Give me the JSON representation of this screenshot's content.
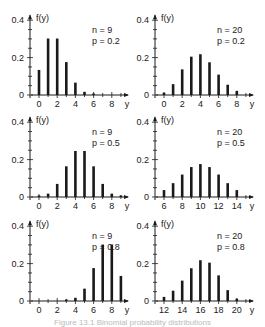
{
  "figure": {
    "caption": "Figure 13.1   Binomial probability distributions"
  },
  "chart_data": [
    {
      "type": "bar",
      "title": "",
      "annotation": [
        "n = 9",
        "p = 0.2"
      ],
      "ylabel": "f(y)",
      "xlabel": "y",
      "ylim": [
        0,
        0.4
      ],
      "yticks": [
        0,
        0.2,
        0.4
      ],
      "ytick_labels": [
        "0",
        "0.2",
        "0.4"
      ],
      "xlim": [
        0,
        9
      ],
      "xticks": [
        0,
        2,
        4,
        6,
        8
      ],
      "x": [
        0,
        1,
        2,
        3,
        4,
        5,
        6,
        7,
        8,
        9
      ],
      "values": [
        0.134,
        0.302,
        0.302,
        0.176,
        0.066,
        0.017,
        0.003,
        0.0,
        0.0,
        0.0
      ],
      "grid": false
    },
    {
      "type": "bar",
      "title": "",
      "annotation": [
        "n = 20",
        "p = 0.2"
      ],
      "ylabel": "f(y)",
      "xlabel": "y",
      "ylim": [
        0,
        0.4
      ],
      "yticks": [
        0,
        0.2,
        0.4
      ],
      "ytick_labels": [
        "0",
        "0.2",
        "0.4"
      ],
      "xlim": [
        0,
        9
      ],
      "xticks": [
        0,
        2,
        4,
        6,
        8
      ],
      "x": [
        0,
        1,
        2,
        3,
        4,
        5,
        6,
        7,
        8
      ],
      "values": [
        0.012,
        0.058,
        0.137,
        0.205,
        0.218,
        0.175,
        0.109,
        0.055,
        0.022
      ],
      "grid": false
    },
    {
      "type": "bar",
      "title": "",
      "annotation": [
        "n = 9",
        "p = 0.5"
      ],
      "ylabel": "f(y)",
      "xlabel": "y",
      "ylim": [
        0,
        0.4
      ],
      "yticks": [
        0,
        0.2,
        0.4
      ],
      "ytick_labels": [
        "0",
        "0.2",
        "0.4"
      ],
      "xlim": [
        0,
        9
      ],
      "xticks": [
        0,
        2,
        4,
        6,
        8
      ],
      "x": [
        0,
        1,
        2,
        3,
        4,
        5,
        6,
        7,
        8,
        9
      ],
      "values": [
        0.002,
        0.018,
        0.07,
        0.164,
        0.246,
        0.246,
        0.164,
        0.07,
        0.018,
        0.002
      ],
      "grid": false
    },
    {
      "type": "bar",
      "title": "",
      "annotation": [
        "n = 20",
        "p = 0.5"
      ],
      "ylabel": "f(y)",
      "xlabel": "y",
      "ylim": [
        0,
        0.4
      ],
      "yticks": [
        0,
        0.2,
        0.4
      ],
      "ytick_labels": [
        "0",
        "0.2",
        "0.4"
      ],
      "xlim": [
        6,
        15
      ],
      "xticks": [
        6,
        8,
        10,
        12,
        14
      ],
      "x": [
        6,
        7,
        8,
        9,
        10,
        11,
        12,
        13,
        14
      ],
      "values": [
        0.037,
        0.074,
        0.12,
        0.16,
        0.176,
        0.16,
        0.12,
        0.074,
        0.037
      ],
      "grid": false
    },
    {
      "type": "bar",
      "title": "",
      "annotation": [
        "n = 9",
        "p = 0.8"
      ],
      "ylabel": "f(y)",
      "xlabel": "y",
      "ylim": [
        0,
        0.4
      ],
      "yticks": [
        0,
        0.2,
        0.4
      ],
      "ytick_labels": [
        "0",
        "0.2",
        "0.4"
      ],
      "xlim": [
        0,
        9
      ],
      "xticks": [
        0,
        2,
        4,
        6,
        8
      ],
      "x": [
        0,
        1,
        2,
        3,
        4,
        5,
        6,
        7,
        8,
        9
      ],
      "values": [
        0.0,
        0.0,
        0.0,
        0.003,
        0.017,
        0.066,
        0.176,
        0.302,
        0.302,
        0.134
      ],
      "grid": false
    },
    {
      "type": "bar",
      "title": "",
      "annotation": [
        "n = 20",
        "p = 0.8"
      ],
      "ylabel": "f(y)",
      "xlabel": "y",
      "ylim": [
        0,
        0.4
      ],
      "yticks": [
        0,
        0.2,
        0.4
      ],
      "ytick_labels": [
        "0",
        "0.2",
        "0.4"
      ],
      "xlim": [
        12,
        21
      ],
      "xticks": [
        12,
        14,
        16,
        18,
        20
      ],
      "x": [
        12,
        13,
        14,
        15,
        16,
        17,
        18,
        19,
        20
      ],
      "values": [
        0.022,
        0.055,
        0.109,
        0.175,
        0.218,
        0.205,
        0.137,
        0.058,
        0.012
      ],
      "grid": false
    }
  ]
}
